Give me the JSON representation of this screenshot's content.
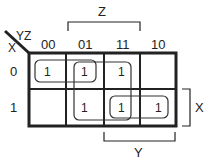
{
  "kmap": {
    "row_var": "X",
    "col_var": "YZ",
    "col_headers": [
      "00",
      "01",
      "11",
      "10"
    ],
    "row_headers": [
      "0",
      "1"
    ],
    "cells": [
      [
        "1",
        "1",
        "1",
        ""
      ],
      [
        "",
        "1",
        "1",
        "1"
      ]
    ],
    "brackets": {
      "top": "Z",
      "right": "X",
      "bottom": "Y"
    },
    "groups": [
      {
        "name": "group-row0-cols00-01"
      },
      {
        "name": "group-cols01-11-both-rows"
      },
      {
        "name": "group-row1-cols11-10"
      }
    ]
  }
}
